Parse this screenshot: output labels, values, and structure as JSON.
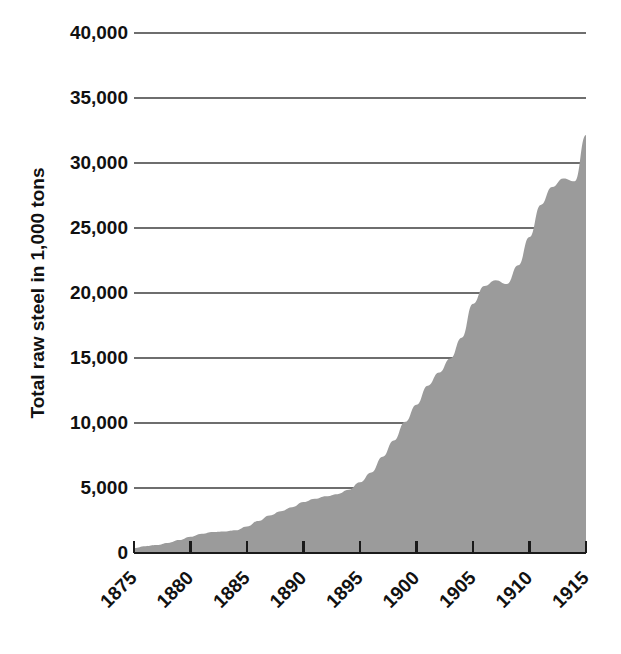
{
  "chart_data": {
    "type": "area",
    "title": "",
    "subtitle": "",
    "xlabel": "",
    "ylabel": "Total raw steel in 1,000 tons",
    "xlim": [
      1875,
      1915
    ],
    "ylim": [
      0,
      40000
    ],
    "grid": true,
    "legend": null,
    "series_color": "#9b9b9b",
    "gridline_color": "#6e6e6e",
    "axis_color": "#1a1a1a",
    "y_ticks": [
      {
        "value": 40000,
        "label": "40,000"
      },
      {
        "value": 35000,
        "label": "35,000"
      },
      {
        "value": 30000,
        "label": "30,000"
      },
      {
        "value": 25000,
        "label": "25,000"
      },
      {
        "value": 20000,
        "label": "20,000"
      },
      {
        "value": 15000,
        "label": "15,000"
      },
      {
        "value": 10000,
        "label": "10,000"
      },
      {
        "value": 5000,
        "label": "5,000"
      },
      {
        "value": 0,
        "label": "0"
      }
    ],
    "x_ticks": [
      {
        "value": 1875,
        "label": "1875"
      },
      {
        "value": 1880,
        "label": "1880"
      },
      {
        "value": 1885,
        "label": "1885"
      },
      {
        "value": 1890,
        "label": "1890"
      },
      {
        "value": 1895,
        "label": "1895"
      },
      {
        "value": 1900,
        "label": "1900"
      },
      {
        "value": 1905,
        "label": "1905"
      },
      {
        "value": 1910,
        "label": "1910"
      },
      {
        "value": 1915,
        "label": "1915"
      }
    ],
    "x": [
      1875,
      1876,
      1877,
      1878,
      1879,
      1880,
      1881,
      1882,
      1883,
      1884,
      1885,
      1886,
      1887,
      1888,
      1889,
      1890,
      1891,
      1892,
      1893,
      1894,
      1895,
      1896,
      1897,
      1898,
      1899,
      1900,
      1901,
      1902,
      1903,
      1904,
      1905,
      1906,
      1907,
      1908,
      1909,
      1910,
      1911,
      1912,
      1913,
      1914,
      1915
    ],
    "values": [
      380,
      530,
      570,
      730,
      935,
      1250,
      1589,
      1737,
      1673,
      1551,
      1712,
      2562,
      3339,
      2900,
      3386,
      4277,
      3904,
      4928,
      4020,
      4412,
      6115,
      5282,
      7157,
      8933,
      10640,
      10188,
      13474,
      14947,
      14535,
      13860,
      20024,
      23398,
      23362,
      14023,
      23955,
      26095,
      23676,
      31251,
      31301,
      23513,
      32151
    ],
    "annotations": []
  }
}
